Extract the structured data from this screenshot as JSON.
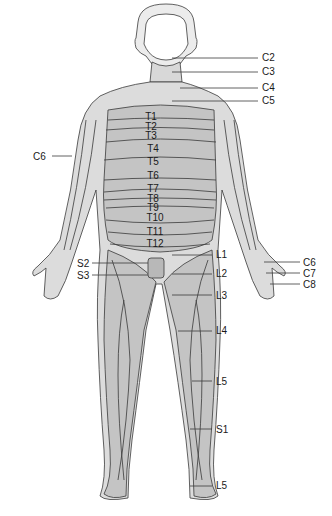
{
  "figure": {
    "colors": {
      "background": "#ffffff",
      "body_dark": "#bdbdbd",
      "body_light": "#dcdcdc",
      "skin_face": "#f4f4f4",
      "outline": "#3a3a3a"
    }
  },
  "labels": {
    "right_side": [
      {
        "text": "C2",
        "x": 262,
        "y": 53
      },
      {
        "text": "C3",
        "x": 262,
        "y": 67
      },
      {
        "text": "C4",
        "x": 262,
        "y": 83
      },
      {
        "text": "C5",
        "x": 262,
        "y": 96
      },
      {
        "text": "L1",
        "x": 216,
        "y": 250
      },
      {
        "text": "L2",
        "x": 216,
        "y": 269
      },
      {
        "text": "L3",
        "x": 216,
        "y": 291
      },
      {
        "text": "L4",
        "x": 216,
        "y": 326
      },
      {
        "text": "L5",
        "x": 216,
        "y": 377
      },
      {
        "text": "S1",
        "x": 216,
        "y": 425
      },
      {
        "text": "L5",
        "x": 216,
        "y": 481
      },
      {
        "text": "C6",
        "x": 303,
        "y": 258
      },
      {
        "text": "C7",
        "x": 303,
        "y": 269
      },
      {
        "text": "C8",
        "x": 303,
        "y": 280
      }
    ],
    "left_side": [
      {
        "text": "C6",
        "x": 33,
        "y": 152
      },
      {
        "text": "S2",
        "x": 77,
        "y": 259
      },
      {
        "text": "S3",
        "x": 77,
        "y": 271
      }
    ],
    "trunk": [
      {
        "text": "T1",
        "x": 151,
        "y": 112
      },
      {
        "text": "T2",
        "x": 151,
        "y": 122
      },
      {
        "text": "T3",
        "x": 151,
        "y": 131
      },
      {
        "text": "T4",
        "x": 153,
        "y": 144
      },
      {
        "text": "T5",
        "x": 153,
        "y": 157
      },
      {
        "text": "T6",
        "x": 153,
        "y": 171
      },
      {
        "text": "T7",
        "x": 153,
        "y": 184
      },
      {
        "text": "T8",
        "x": 153,
        "y": 194
      },
      {
        "text": "T9",
        "x": 153,
        "y": 203
      },
      {
        "text": "T10",
        "x": 155,
        "y": 213
      },
      {
        "text": "T11",
        "x": 155,
        "y": 227
      },
      {
        "text": "T12",
        "x": 155,
        "y": 239
      }
    ]
  }
}
